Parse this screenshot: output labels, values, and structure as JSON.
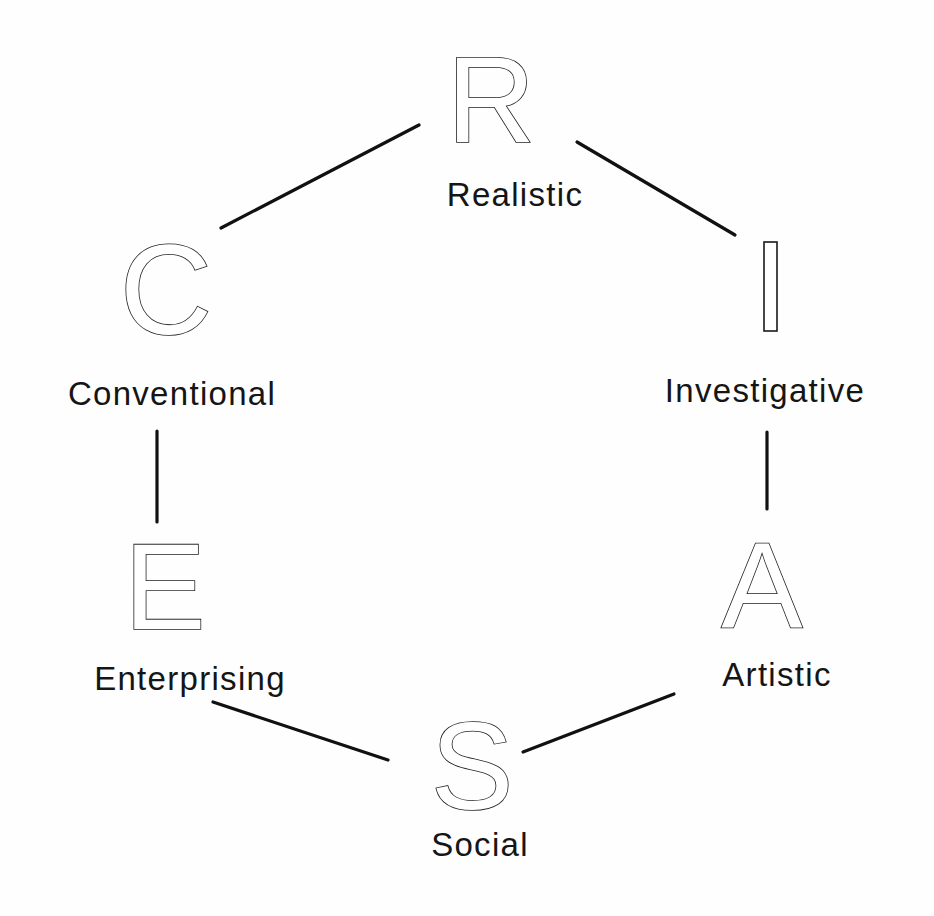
{
  "diagram": {
    "nodes": [
      {
        "id": "R",
        "letter": "R",
        "label": "Realistic"
      },
      {
        "id": "I",
        "letter": "I",
        "label": "Investigative"
      },
      {
        "id": "A",
        "letter": "A",
        "label": "Artistic"
      },
      {
        "id": "S",
        "letter": "S",
        "label": "Social"
      },
      {
        "id": "E",
        "letter": "E",
        "label": "Enterprising"
      },
      {
        "id": "C",
        "letter": "C",
        "label": "Conventional"
      }
    ],
    "edges": [
      {
        "from": "R",
        "to": "I"
      },
      {
        "from": "I",
        "to": "A"
      },
      {
        "from": "A",
        "to": "S"
      },
      {
        "from": "S",
        "to": "E"
      },
      {
        "from": "E",
        "to": "C"
      },
      {
        "from": "C",
        "to": "R"
      }
    ],
    "colors": {
      "line": "#111111",
      "text": "#151515",
      "background": "#fefefe"
    }
  }
}
